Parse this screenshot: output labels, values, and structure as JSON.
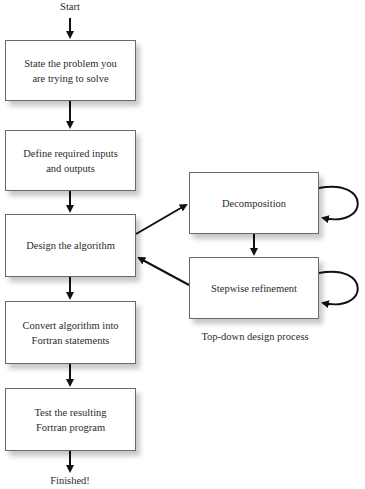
{
  "diagram": {
    "start_label": "Start",
    "end_label": "Finished!",
    "main_steps": [
      {
        "line1": "State the problem you",
        "line2": "are trying to solve"
      },
      {
        "line1": "Define required inputs",
        "line2": "and outputs"
      },
      {
        "line1": "Design the algorithm",
        "line2": ""
      },
      {
        "line1": "Convert algorithm into",
        "line2": "Fortran statements"
      },
      {
        "line1": "Test the resulting",
        "line2": "Fortran program"
      }
    ],
    "subprocess": {
      "steps": [
        {
          "label": "Decomposition"
        },
        {
          "label": "Stepwise refinement"
        }
      ],
      "caption": "Top-down design process"
    }
  }
}
